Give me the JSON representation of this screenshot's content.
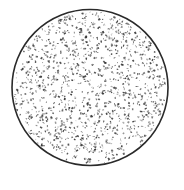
{
  "figure": {
    "shape": "circle",
    "center": [
      90,
      87.5
    ],
    "radius": 78,
    "fill": "#ffffff",
    "stroke": "#2a2a2a",
    "stroke_width": 1.6,
    "texture": {
      "kind": "random-speckle",
      "count": 1300,
      "color": "#333333",
      "seed": 42
    }
  }
}
